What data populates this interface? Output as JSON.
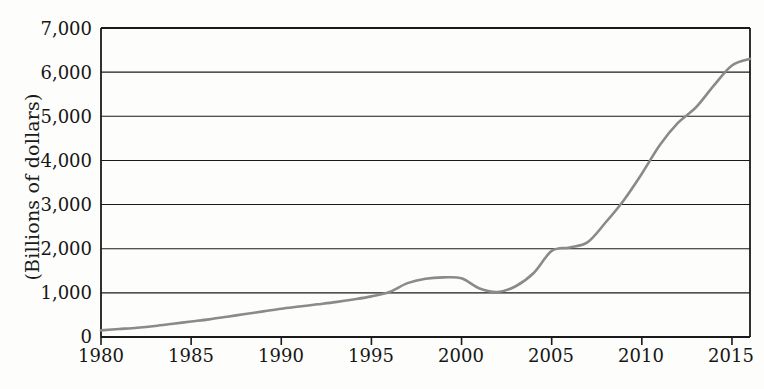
{
  "chart_data": {
    "type": "line",
    "title": "",
    "subtitle": "",
    "xlabel": "",
    "ylabel": "(Billions of dollars)",
    "xlim": [
      1980,
      2016
    ],
    "ylim": [
      0,
      7000
    ],
    "grid": true,
    "legend": false,
    "legend_position": "none",
    "y_ticks": [
      "0",
      "1,000",
      "2,000",
      "3,000",
      "4,000",
      "5,000",
      "6,000",
      "7,000"
    ],
    "y_tick_values": [
      0,
      1000,
      2000,
      3000,
      4000,
      5000,
      6000,
      7000
    ],
    "x_ticks": [
      "1980",
      "1985",
      "1990",
      "1995",
      "2000",
      "2005",
      "2010",
      "2015"
    ],
    "x_tick_values": [
      1980,
      1985,
      1990,
      1995,
      2000,
      2005,
      2010,
      2015
    ],
    "line_color": "#8a8a8a",
    "axis_color": "#1a1a1a",
    "background_color": "#fdfdfb",
    "series": [
      {
        "name": "",
        "x": [
          1980,
          1981,
          1982,
          1983,
          1984,
          1985,
          1986,
          1987,
          1988,
          1989,
          1990,
          1991,
          1992,
          1993,
          1994,
          1995,
          1996,
          1997,
          1998,
          1999,
          2000,
          2001,
          2002,
          2003,
          2004,
          2005,
          2006,
          2007,
          2008,
          2009,
          2010,
          2011,
          2012,
          2013,
          2014,
          2015,
          2016
        ],
        "values": [
          150,
          180,
          210,
          250,
          300,
          350,
          400,
          460,
          520,
          580,
          640,
          690,
          740,
          790,
          850,
          920,
          1020,
          1220,
          1320,
          1350,
          1330,
          1100,
          1020,
          1150,
          1450,
          1950,
          2030,
          2150,
          2600,
          3100,
          3700,
          4350,
          4850,
          5200,
          5700,
          6150,
          6300
        ]
      }
    ]
  }
}
